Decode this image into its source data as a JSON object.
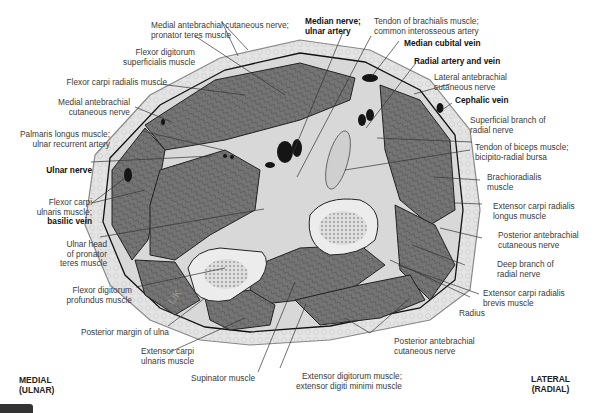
{
  "orientation": {
    "medial": [
      "MEDIAL",
      "(ULNAR)"
    ],
    "lateral": [
      "LATERAL",
      "(RADIAL)"
    ]
  },
  "artist_mark": "LIK",
  "labels": {
    "med_ante_pronator": [
      "Medial antebrachial cutaneous nerve;",
      "pronator teres muscle"
    ],
    "fds": [
      "Flexor digitorum",
      "superficialis muscle"
    ],
    "fcr": [
      "Flexor carpi radialis muscle"
    ],
    "med_ante": [
      "Medial antebrachial",
      "cutaneous nerve"
    ],
    "palmaris": [
      "Palmaris longus muscle;",
      "ulnar recurrent artery"
    ],
    "ulnar_nerve": [
      "Ulnar nerve"
    ],
    "fcu": [
      "Flexor carpi",
      "ulnaris muscle;",
      "basilic vein"
    ],
    "ulnar_head": [
      "Ulnar head",
      "of pronator",
      "teres muscle"
    ],
    "fdp": [
      "Flexor digitorum",
      "profundus muscle"
    ],
    "post_margin": [
      "Posterior margin of ulna"
    ],
    "ecu": [
      "Extensor carpi",
      "ulnaris muscle"
    ],
    "supinator": [
      "Supinator muscle"
    ],
    "ext_dig": [
      "Extensor digitorum muscle;",
      "extensor digiti minimi muscle"
    ],
    "post_ante_bottom": [
      "Posterior antebrachial",
      "cutaneous nerve"
    ],
    "radius": [
      "Radius"
    ],
    "ecrb": [
      "Extensor carpi radialis",
      "brevis muscle"
    ],
    "deep_radial": [
      "Deep branch of",
      "radial nerve"
    ],
    "post_ante_right": [
      "Posterior antebrachial",
      "cutaneous nerve"
    ],
    "ecrl": [
      "Extensor carpi radialis",
      "longus muscle"
    ],
    "brachioradialis": [
      "Brachioradialis",
      "muscle"
    ],
    "biceps_tendon": [
      "Tendon of biceps muscle;",
      "bicipito-radial bursa"
    ],
    "superficial_radial": [
      "Superficial branch of",
      "radial nerve"
    ],
    "cephalic": [
      "Cephalic vein"
    ],
    "lat_ante": [
      "Lateral antebrachial",
      "cutaneous nerve"
    ],
    "radial_artery": [
      "Radial artery and vein"
    ],
    "median_cubital": [
      "Median cubital vein"
    ],
    "brachialis": [
      "Tendon of brachialis muscle;",
      "common interosseous artery"
    ],
    "median_nerve": [
      "Median nerve;",
      "ulnar artery"
    ]
  },
  "colors": {
    "skin": "#d9d9d9",
    "fat": "#e8e8e8",
    "muscle": "#6e6e6e",
    "muscle_dark": "#4a4a4a",
    "bone": "#ececec",
    "vessel": "#1a1a1a",
    "leader": "#333333"
  }
}
